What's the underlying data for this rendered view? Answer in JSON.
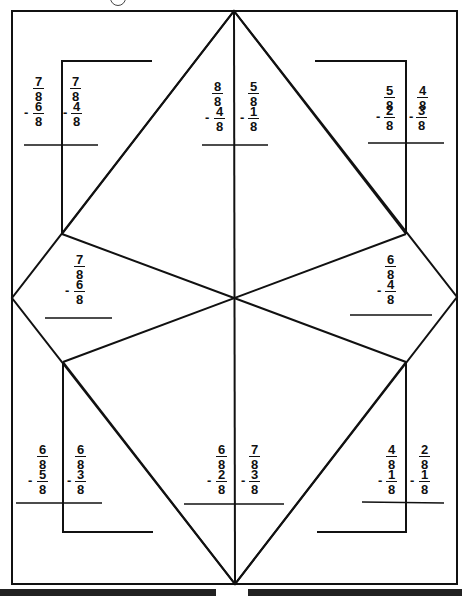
{
  "worksheet": {
    "title_marker": "circled problem number (cut off at top)",
    "page_number_cut_off": true,
    "line_color": "#111111",
    "background": "#ffffff"
  },
  "problems": [
    {
      "id": "tl-a",
      "region": "top-left",
      "minuend": {
        "num": "7",
        "den": "8"
      },
      "subtrahend": {
        "num": "6",
        "den": "8"
      }
    },
    {
      "id": "tl-b",
      "region": "top-left",
      "minuend": {
        "num": "7",
        "den": "8"
      },
      "subtrahend": {
        "num": "4",
        "den": "8"
      }
    },
    {
      "id": "tc-a",
      "region": "top-center",
      "minuend": {
        "num": "8",
        "den": "8"
      },
      "subtrahend": {
        "num": "4",
        "den": "8"
      }
    },
    {
      "id": "tc-b",
      "region": "top-center",
      "minuend": {
        "num": "5",
        "den": "8"
      },
      "subtrahend": {
        "num": "1",
        "den": "8"
      }
    },
    {
      "id": "tr-a",
      "region": "top-right",
      "minuend": {
        "num": "5",
        "den": "8"
      },
      "subtrahend": {
        "num": "2",
        "den": "8"
      }
    },
    {
      "id": "tr-b",
      "region": "top-right",
      "minuend": {
        "num": "4",
        "den": "8"
      },
      "subtrahend": {
        "num": "3",
        "den": "8"
      }
    },
    {
      "id": "ml",
      "region": "middle-left",
      "minuend": {
        "num": "7",
        "den": "8"
      },
      "subtrahend": {
        "num": "5",
        "den": "8"
      }
    },
    {
      "id": "mr",
      "region": "middle-right",
      "minuend": {
        "num": "6",
        "den": "8"
      },
      "subtrahend": {
        "num": "4",
        "den": "8"
      }
    },
    {
      "id": "bl-a",
      "region": "bottom-left",
      "minuend": {
        "num": "6",
        "den": "8"
      },
      "subtrahend": {
        "num": "5",
        "den": "8"
      }
    },
    {
      "id": "bl-b",
      "region": "bottom-left",
      "minuend": {
        "num": "6",
        "den": "8"
      },
      "subtrahend": {
        "num": "3",
        "den": "8"
      }
    },
    {
      "id": "bc-a",
      "region": "bottom-center",
      "minuend": {
        "num": "6",
        "den": "8"
      },
      "subtrahend": {
        "num": "2",
        "den": "8"
      }
    },
    {
      "id": "bc-b",
      "region": "bottom-center",
      "minuend": {
        "num": "7",
        "den": "8"
      },
      "subtrahend": {
        "num": "3",
        "den": "8"
      }
    },
    {
      "id": "br-a",
      "region": "bottom-right",
      "minuend": {
        "num": "4",
        "den": "8"
      },
      "subtrahend": {
        "num": "1",
        "den": "8"
      }
    },
    {
      "id": "br-b",
      "region": "bottom-right",
      "minuend": {
        "num": "2",
        "den": "8"
      },
      "subtrahend": {
        "num": "1",
        "den": "8"
      }
    }
  ],
  "symbols": {
    "minus": "-"
  }
}
